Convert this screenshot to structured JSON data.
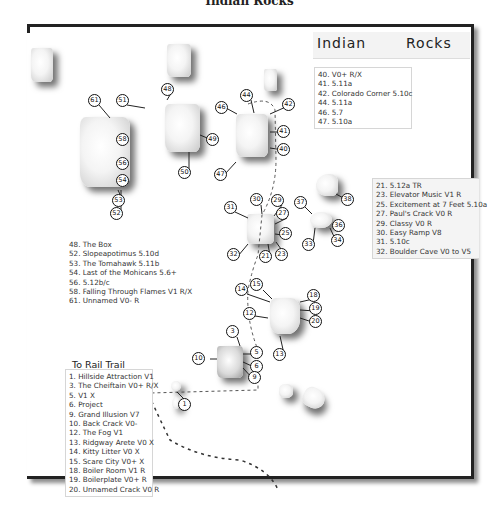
{
  "page_title": "Indian Rocks",
  "map_title": {
    "word1": "Indian",
    "word2": "Rocks"
  },
  "direction_label": "To  Rail Trail",
  "legends": {
    "top_right": [
      "40. V0+ R/X",
      "41. 5.11a",
      "42. Colorado Corner 5.10c",
      "44. 5.11a",
      "46. 5.7",
      "47. 5.10a"
    ],
    "middle_right": [
      "21. 5.12a  TR",
      "23. Elevator Music V1 R",
      "25. Excitement at 7 Feet 5.10a",
      "27. Paul's Crack V0 R",
      "29.  Classy V0 R",
      "30. Easy Ramp V8",
      "31. 5.10c",
      "32. Boulder Cave  V0 to V5"
    ],
    "middle_left": [
      "48. The Box",
      "52. Slopeapotimus 5.10d",
      "53. The Tomahawk 5.11b",
      "54. Last of the Mohicans 5.6+",
      "56. 5.12b/c",
      "58. Falling Through Flames V1 R/X",
      "61. Unnamed V0- R"
    ],
    "bottom_left": [
      "1. Hillside Attraction V1",
      "3. The Cheiftain V0+ R/X",
      "5. V1 X",
      "6. Project",
      "9. Grand Illusion V7",
      "10. Back Crack V0-",
      "12. The Fog V1",
      "13. Ridgway Arete V0 X",
      "14. Kitty Litter V0 X",
      "15. Scare City V0+ X",
      "18. Boiler Room V1 R",
      "19. Boilerplate V0+ R",
      "20. Unnamed Crack V0 R"
    ]
  },
  "markers": [
    {
      "n": "61",
      "x": 94,
      "y": 100
    },
    {
      "n": "51",
      "x": 122,
      "y": 100
    },
    {
      "n": "48",
      "x": 167,
      "y": 89
    },
    {
      "n": "58",
      "x": 122,
      "y": 139
    },
    {
      "n": "56",
      "x": 122,
      "y": 163
    },
    {
      "n": "54",
      "x": 122,
      "y": 180
    },
    {
      "n": "53",
      "x": 118,
      "y": 200
    },
    {
      "n": "52",
      "x": 116,
      "y": 213
    },
    {
      "n": "49",
      "x": 212,
      "y": 139
    },
    {
      "n": "50",
      "x": 184,
      "y": 172
    },
    {
      "n": "46",
      "x": 221,
      "y": 107
    },
    {
      "n": "44",
      "x": 246,
      "y": 95
    },
    {
      "n": "42",
      "x": 288,
      "y": 104
    },
    {
      "n": "41",
      "x": 283,
      "y": 131
    },
    {
      "n": "40",
      "x": 283,
      "y": 149
    },
    {
      "n": "47",
      "x": 220,
      "y": 174
    },
    {
      "n": "31",
      "x": 230,
      "y": 207
    },
    {
      "n": "30",
      "x": 256,
      "y": 199
    },
    {
      "n": "29",
      "x": 277,
      "y": 200
    },
    {
      "n": "27",
      "x": 282,
      "y": 213
    },
    {
      "n": "25",
      "x": 285,
      "y": 233
    },
    {
      "n": "23",
      "x": 281,
      "y": 254
    },
    {
      "n": "21",
      "x": 265,
      "y": 256
    },
    {
      "n": "32",
      "x": 233,
      "y": 254
    },
    {
      "n": "37",
      "x": 300,
      "y": 202
    },
    {
      "n": "38",
      "x": 347,
      "y": 199
    },
    {
      "n": "36",
      "x": 338,
      "y": 225
    },
    {
      "n": "34",
      "x": 337,
      "y": 240
    },
    {
      "n": "33",
      "x": 308,
      "y": 244
    },
    {
      "n": "15",
      "x": 256,
      "y": 284
    },
    {
      "n": "14",
      "x": 241,
      "y": 289
    },
    {
      "n": "18",
      "x": 313,
      "y": 295
    },
    {
      "n": "19",
      "x": 315,
      "y": 308
    },
    {
      "n": "20",
      "x": 315,
      "y": 321
    },
    {
      "n": "12",
      "x": 249,
      "y": 313
    },
    {
      "n": "13",
      "x": 279,
      "y": 354
    },
    {
      "n": "3",
      "x": 232,
      "y": 331
    },
    {
      "n": "10",
      "x": 198,
      "y": 358
    },
    {
      "n": "5",
      "x": 256,
      "y": 352
    },
    {
      "n": "6",
      "x": 256,
      "y": 366
    },
    {
      "n": "9",
      "x": 254,
      "y": 377
    },
    {
      "n": "1",
      "x": 184,
      "y": 404
    }
  ],
  "colors": {
    "frame": "#222222",
    "title_box": "#f3f3f3",
    "legend_gray": "#f4f4f4",
    "trail": "#333333"
  }
}
